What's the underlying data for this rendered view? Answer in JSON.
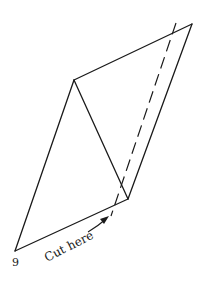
{
  "diagram": {
    "step_number": "9",
    "cut_label": "Cut here",
    "colors": {
      "stroke": "#1a1a1a",
      "background": "#ffffff"
    },
    "vertices": {
      "top_right": [
        192,
        24
      ],
      "left_middle": [
        74,
        80
      ],
      "bottom_right_middle": [
        128,
        199
      ],
      "bottom_left": [
        15,
        251
      ]
    },
    "cut_line": {
      "style": "dashed",
      "from": [
        176,
        23
      ],
      "to": [
        111,
        216
      ]
    }
  }
}
